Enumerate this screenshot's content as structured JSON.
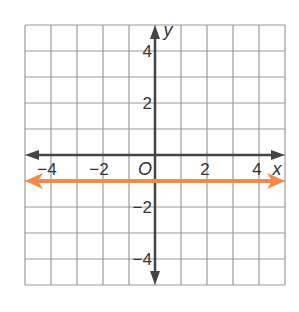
{
  "chart_data": {
    "type": "line",
    "title": "",
    "xlabel": "x",
    "ylabel": "y",
    "xlim": [
      -5,
      5
    ],
    "ylim": [
      -5,
      5
    ],
    "grid": true,
    "grid_step": 1,
    "origin_label": "O",
    "x_ticks": [
      {
        "value": -4,
        "label": "−4"
      },
      {
        "value": -2,
        "label": "−2"
      },
      {
        "value": 2,
        "label": "2"
      },
      {
        "value": 4,
        "label": "4"
      }
    ],
    "y_ticks": [
      {
        "value": 4,
        "label": "4"
      },
      {
        "value": 2,
        "label": "2"
      },
      {
        "value": -2,
        "label": "−2"
      },
      {
        "value": -4,
        "label": "−4"
      }
    ],
    "series": [
      {
        "name": "y = -1",
        "equation": "y = -1",
        "x": [
          -5,
          5
        ],
        "y": [
          -1,
          -1
        ],
        "color": "#f28a4a",
        "arrows": "both"
      }
    ]
  },
  "colors": {
    "grid": "#9a9a9a",
    "axis": "#444444",
    "line": "#f28a4a"
  }
}
